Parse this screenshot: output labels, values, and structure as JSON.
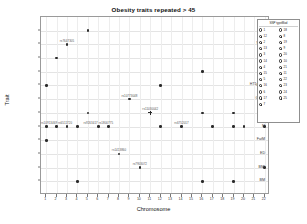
{
  "chart_data": {
    "type": "scatter",
    "title": "Obesity traits repeated > 45",
    "xlabel": "Chromosome",
    "ylabel": "Trait",
    "grid": true,
    "legend_position": "right",
    "legend_title": "SNP typeMod",
    "xlim": [
      0.5,
      22.5
    ],
    "x_ticks": [
      1,
      2,
      3,
      4,
      5,
      6,
      7,
      8,
      9,
      10,
      11,
      12,
      13,
      14,
      15,
      16,
      17,
      18,
      19,
      20,
      21,
      22
    ],
    "y_categories": [
      "WL",
      "WHR",
      "WC",
      "W",
      "HT1pBMI",
      "GLOb",
      "O",
      "M",
      "FatM",
      "ED",
      "BMI",
      "BM"
    ],
    "y_ticks": [
      "WL",
      "WHR",
      "WC",
      "W",
      "HT1pBMI",
      "GLOb",
      "O",
      "M",
      "FatM",
      "ED",
      "BMI",
      "BM"
    ],
    "points": [
      {
        "x": 5,
        "y": "WL",
        "label": ""
      },
      {
        "x": 3,
        "y": "WHR",
        "label": "rs7647305"
      },
      {
        "x": 2,
        "y": "WC",
        "label": ""
      },
      {
        "x": 16,
        "y": "W",
        "label": ""
      },
      {
        "x": 1,
        "y": "HT1pBMI",
        "label": ""
      },
      {
        "x": 12,
        "y": "HT1pBMI",
        "label": ""
      },
      {
        "x": 9,
        "y": "GLOb",
        "label": "rs10773048"
      },
      {
        "x": 5,
        "y": "O",
        "label": ""
      },
      {
        "x": 11,
        "y": "O",
        "label": "rs11030042"
      },
      {
        "x": 16,
        "y": "O",
        "label": ""
      },
      {
        "x": 19,
        "y": "O",
        "label": ""
      },
      {
        "x": 1,
        "y": "M",
        "label": ""
      },
      {
        "x": 2,
        "y": "M",
        "label": "rs10913469 rs6511720"
      },
      {
        "x": 3,
        "y": "M",
        "label": ""
      },
      {
        "x": 4,
        "y": "M",
        "label": ""
      },
      {
        "x": 6,
        "y": "M",
        "label": "rs9263417 rs1800775"
      },
      {
        "x": 7,
        "y": "M",
        "label": ""
      },
      {
        "x": 12,
        "y": "M",
        "label": ""
      },
      {
        "x": 14,
        "y": "M",
        "label": "rs6752017"
      },
      {
        "x": 17,
        "y": "M",
        "label": ""
      },
      {
        "x": 19,
        "y": "M",
        "label": ""
      },
      {
        "x": 20,
        "y": "M",
        "label": ""
      },
      {
        "x": 22,
        "y": "M",
        "label": ""
      },
      {
        "x": 1,
        "y": "FatM",
        "label": ""
      },
      {
        "x": 8,
        "y": "ED",
        "label": "rs1413860"
      },
      {
        "x": 10,
        "y": "BMI",
        "label": "rs7903072"
      },
      {
        "x": 22,
        "y": "BMI",
        "label": ""
      },
      {
        "x": 4,
        "y": "BM",
        "label": ""
      },
      {
        "x": 16,
        "y": "BM",
        "label": ""
      },
      {
        "x": 19,
        "y": "BM",
        "label": ""
      }
    ],
    "legend_entries": [
      "1",
      "12",
      "2",
      "13",
      "3",
      "14",
      "4",
      "15",
      "5",
      "16",
      "6",
      "17",
      "7",
      "18",
      "8",
      "19",
      "9",
      "20",
      "10",
      "21",
      "11",
      "22",
      "23",
      "24",
      "25"
    ]
  },
  "colors": {
    "point": "#2b2b2b",
    "frame": "#9a9a9a",
    "grid": "#e4e4e4",
    "text": "#111111"
  }
}
